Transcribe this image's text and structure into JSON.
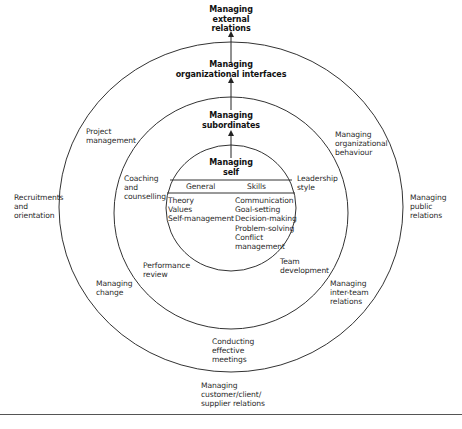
{
  "diagram": {
    "levels": [
      {
        "id": "self",
        "label": "Managing\nself"
      },
      {
        "id": "subordinates",
        "label": "Managing\nsubordinates"
      },
      {
        "id": "interfaces",
        "label": "Managing\norganizational interfaces"
      },
      {
        "id": "external",
        "label": "Managing\nexternal\nrelations"
      }
    ],
    "inner_circle": {
      "columns": [
        {
          "header": "General",
          "items": "Theory\nValues\nSelf-management"
        },
        {
          "header": "Skills",
          "items": "Communication\nGoal-setting\nDecision-making\nProblem-solving\nConflict\nmanagement"
        }
      ]
    },
    "middle_ring_items": [
      {
        "label": "Coaching\nand\ncounselling"
      },
      {
        "label": "Leadership\nstyle"
      },
      {
        "label": "Performance\nreview"
      },
      {
        "label": "Team\ndevelopment"
      },
      {
        "label": "Conducting\neffective\nmeetings"
      }
    ],
    "outer_ring_items": [
      {
        "label": "Project\nmanagement"
      },
      {
        "label": "Managing\norganizational\nbehaviour"
      },
      {
        "label": "Managing\nchange"
      },
      {
        "label": "Managing\ninter-team\nrelations"
      }
    ],
    "outside_items": [
      {
        "label": "Recruitments\nand\norientation"
      },
      {
        "label": "Managing\npublic\nrelations"
      },
      {
        "label": "Managing\ncustomer/client/\nsupplier relations"
      }
    ],
    "colors": {
      "line": "#333333",
      "text": "#2a2a2a",
      "background": "#ffffff"
    }
  }
}
